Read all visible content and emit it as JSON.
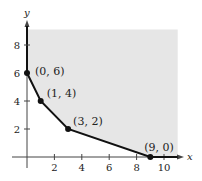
{
  "chart_data": {
    "type": "line",
    "title": "",
    "xlabel": "x",
    "ylabel": "y",
    "xlim": [
      0,
      11
    ],
    "ylim": [
      0,
      9.5
    ],
    "grid": false,
    "legend": null,
    "x_ticks": [
      2,
      4,
      6,
      8,
      10
    ],
    "y_ticks": [
      2,
      4,
      6,
      8
    ],
    "x_tick_labels": [
      "2",
      "4",
      "6",
      "8",
      "10"
    ],
    "y_tick_labels": [
      "2",
      "4",
      "6",
      "8"
    ],
    "series": [
      {
        "name": "boundary",
        "x": [
          0,
          1,
          3,
          9
        ],
        "y": [
          6,
          4,
          2,
          0
        ]
      }
    ],
    "points": [
      {
        "x": 0,
        "y": 6,
        "label": "(0, 6)"
      },
      {
        "x": 1,
        "y": 4,
        "label": "(1, 4)"
      },
      {
        "x": 3,
        "y": 2,
        "label": "(3, 2)"
      },
      {
        "x": 9,
        "y": 0,
        "label": "(9, 0)"
      }
    ],
    "shaded_region": {
      "description": "unbounded feasible region above/right of the boundary, clipped at x≈11, y≈9.5",
      "color": "#e6e6e6"
    },
    "colors": {
      "line": "#111111",
      "axis": "#444444",
      "fill": "#e6e6e6"
    }
  }
}
